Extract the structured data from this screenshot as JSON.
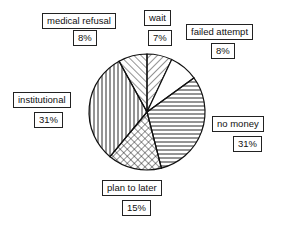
{
  "chart_data": {
    "type": "pie",
    "title": "",
    "categories": [
      "wait",
      "failed attempt",
      "no money",
      "plan to later",
      "institutional",
      "medical refusal"
    ],
    "values": [
      7,
      8,
      31,
      15,
      31,
      8
    ],
    "labels": [
      "7%",
      "8%",
      "31%",
      "15%",
      "31%",
      "8%"
    ],
    "fills": [
      "diagonal hatch (\\)",
      "white",
      "horizontal lines",
      "crosshatch",
      "vertical lines",
      "diagonal hatch (/)"
    ],
    "legend": "callout boxes"
  },
  "slices": {
    "medical_refusal": {
      "name": "medical refusal",
      "pct": "8%"
    },
    "wait": {
      "name": "wait",
      "pct": "7%"
    },
    "failed_attempt": {
      "name": "failed attempt",
      "pct": "8%"
    },
    "no_money": {
      "name": "no money",
      "pct": "31%"
    },
    "plan_to_later": {
      "name": "plan to later",
      "pct": "15%"
    },
    "institutional": {
      "name": "institutional",
      "pct": "31%"
    }
  }
}
